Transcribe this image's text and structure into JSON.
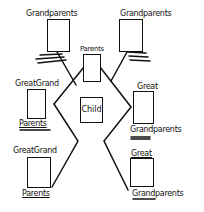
{
  "diagram": {
    "colors": {
      "ink": "#111111",
      "paper": "#ffffff"
    },
    "nodes": {
      "grandparents_left": {
        "label": "Grandparents"
      },
      "grandparents_right": {
        "label": "Grandparents"
      },
      "parents": {
        "label": "Parents"
      },
      "child": {
        "label": "Child"
      },
      "great_grand_parents_upper_left": {
        "label_top": "GreatGrand",
        "label_bottom": "Parents"
      },
      "great_grandparents_upper_right": {
        "label_top": "Great",
        "label_bottom": "Grandparents"
      },
      "great_grand_parents_lower_left": {
        "label_top": "GreatGrand",
        "label_bottom": "Parents"
      },
      "great_grandparents_lower_right": {
        "label_top": "Great",
        "label_bottom": "Grandparents"
      }
    },
    "edges": [
      {
        "from": "grandparents_left",
        "to": "parents"
      },
      {
        "from": "grandparents_right",
        "to": "parents"
      },
      {
        "from": "parents",
        "to": "child"
      },
      {
        "from": "child",
        "to": "great_grand_parents_upper_left"
      },
      {
        "from": "child",
        "to": "great_grandparents_upper_right"
      },
      {
        "from": "child",
        "to": "great_grand_parents_lower_left"
      },
      {
        "from": "child",
        "to": "great_grandparents_lower_right"
      }
    ]
  }
}
